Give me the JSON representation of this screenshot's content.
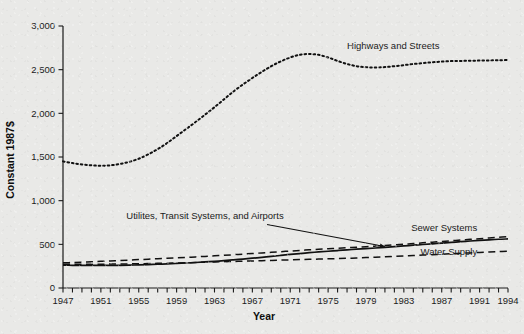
{
  "chart_data": {
    "type": "line",
    "title": "",
    "xlabel": "Year",
    "ylabel": "Constant 1987$",
    "xlim": [
      1947,
      1994
    ],
    "ylim": [
      0,
      3000
    ],
    "grid": false,
    "legend": "inline-annotations",
    "y_ticks": [
      0,
      500,
      1000,
      1500,
      2000,
      2500,
      3000
    ],
    "y_tick_labels": [
      "0",
      "500",
      "1,000",
      "1,500",
      "2,000",
      "2,500",
      "3,000"
    ],
    "x_tick_labels": [
      "1947",
      "1951",
      "1955",
      "1959",
      "1963",
      "1967",
      "1971",
      "1975",
      "1979",
      "1983",
      "1987",
      "1991",
      "1994"
    ],
    "x_tick_label_years": [
      1947,
      1951,
      1955,
      1959,
      1963,
      1967,
      1971,
      1975,
      1979,
      1983,
      1987,
      1991,
      1994
    ],
    "x_minor_tick_interval": 1,
    "x": [
      1947,
      1948,
      1949,
      1950,
      1951,
      1952,
      1953,
      1954,
      1955,
      1956,
      1957,
      1958,
      1959,
      1960,
      1961,
      1962,
      1963,
      1964,
      1965,
      1966,
      1967,
      1968,
      1969,
      1970,
      1971,
      1972,
      1973,
      1974,
      1975,
      1976,
      1977,
      1978,
      1979,
      1980,
      1981,
      1982,
      1983,
      1984,
      1985,
      1986,
      1987,
      1988,
      1989,
      1990,
      1991,
      1992,
      1993,
      1994
    ],
    "series": [
      {
        "name": "Highways and Streets",
        "style": "dotted",
        "label_x": 1977,
        "label_y": 2740,
        "values": [
          1450,
          1430,
          1415,
          1405,
          1400,
          1405,
          1420,
          1445,
          1480,
          1530,
          1590,
          1660,
          1740,
          1820,
          1900,
          1985,
          2070,
          2160,
          2250,
          2330,
          2405,
          2475,
          2540,
          2595,
          2640,
          2670,
          2680,
          2670,
          2640,
          2600,
          2565,
          2540,
          2528,
          2525,
          2530,
          2540,
          2552,
          2565,
          2575,
          2585,
          2592,
          2598,
          2600,
          2602,
          2604,
          2606,
          2608,
          2610
        ]
      },
      {
        "name": "Utilites, Transit Systems, and Airports",
        "style": "solid",
        "label_x": 1962,
        "label_y": 795,
        "annotation": "arrow",
        "arrow_to_x": 1981,
        "arrow_to_y": 452,
        "values": [
          262,
          260,
          259,
          258,
          258,
          259,
          260,
          262,
          265,
          268,
          272,
          276,
          281,
          286,
          292,
          298,
          305,
          313,
          322,
          331,
          341,
          351,
          362,
          373,
          384,
          394,
          404,
          413,
          421,
          429,
          437,
          444,
          451,
          458,
          466,
          474,
          482,
          490,
          498,
          506,
          514,
          522,
          530,
          538,
          545,
          552,
          558,
          562
        ]
      },
      {
        "name": "Sewer Systems",
        "style": "dashed",
        "label_x": 1988,
        "label_y": 655,
        "values": [
          288,
          292,
          296,
          300,
          305,
          310,
          315,
          320,
          325,
          330,
          335,
          340,
          345,
          350,
          356,
          362,
          368,
          374,
          381,
          388,
          395,
          402,
          409,
          416,
          423,
          430,
          437,
          443,
          449,
          455,
          461,
          467,
          473,
          480,
          487,
          494,
          501,
          509,
          517,
          525,
          533,
          541,
          549,
          557,
          565,
          573,
          580,
          588
        ]
      },
      {
        "name": "Water Supply",
        "style": "dashed",
        "label_x": 1988,
        "label_y": 382,
        "values": [
          272,
          272,
          272,
          272,
          273,
          274,
          275,
          276,
          278,
          280,
          282,
          284,
          286,
          289,
          292,
          295,
          298,
          301,
          304,
          307,
          310,
          313,
          316,
          319,
          322,
          325,
          328,
          331,
          334,
          337,
          340,
          344,
          348,
          352,
          357,
          362,
          367,
          372,
          377,
          382,
          387,
          392,
          397,
          402,
          407,
          412,
          417,
          422
        ]
      }
    ]
  }
}
